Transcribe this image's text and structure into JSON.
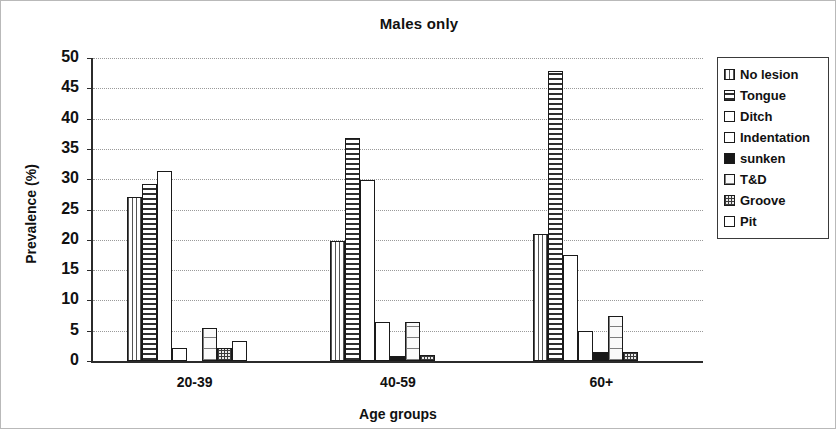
{
  "chart_data": {
    "type": "bar",
    "title": "Males only",
    "xlabel": "Age groups",
    "ylabel": "Prevalence (%)",
    "categories": [
      "20-39",
      "40-59",
      "60+"
    ],
    "ylim": [
      0,
      50
    ],
    "yticks": [
      0,
      5,
      10,
      15,
      20,
      25,
      30,
      35,
      40,
      45,
      50
    ],
    "grid": true,
    "legend_position": "right",
    "series": [
      {
        "name": "No lesion",
        "pattern": "vertical-lines",
        "values": [
          27.0,
          19.8,
          21.0
        ]
      },
      {
        "name": "Tongue",
        "pattern": "horizontal-lines",
        "values": [
          29.2,
          36.8,
          47.8
        ]
      },
      {
        "name": "Ditch",
        "pattern": "empty",
        "values": [
          31.3,
          29.8,
          17.5
        ]
      },
      {
        "name": "Indentation",
        "pattern": "empty",
        "values": [
          2.2,
          6.5,
          5.0
        ]
      },
      {
        "name": "sunken",
        "pattern": "solid-black",
        "values": [
          0.0,
          0.8,
          1.5
        ]
      },
      {
        "name": "T&D",
        "pattern": "brick",
        "values": [
          5.5,
          6.5,
          7.5
        ]
      },
      {
        "name": "Groove",
        "pattern": "dots",
        "values": [
          2.2,
          1.0,
          1.5
        ]
      },
      {
        "name": "Pit",
        "pattern": "empty",
        "values": [
          3.3,
          0.0,
          0.0
        ]
      }
    ]
  },
  "colors": {
    "axis": "#2b2b2b",
    "grid": "#9a9a9a",
    "bar_outline": "#1a1a1a",
    "background": "#ffffff"
  }
}
